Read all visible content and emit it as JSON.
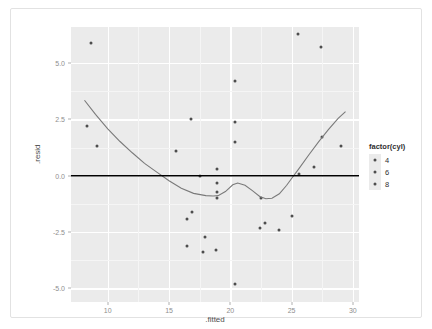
{
  "chart_data": {
    "type": "scatter",
    "title": "",
    "xlabel": ".fitted",
    "ylabel": ".resid",
    "xlim": [
      7.0,
      30.5
    ],
    "ylim": [
      -5.6,
      6.6
    ],
    "xticks": [
      10,
      15,
      20,
      25,
      30
    ],
    "xtick_labels": [
      "10",
      "15",
      "20",
      "25",
      "30"
    ],
    "yticks": [
      5.0,
      2.5,
      0.0,
      -2.5,
      -5.0
    ],
    "ytick_labels": [
      "5.0",
      "2.5",
      "0.0",
      "-2.5",
      "-5.0"
    ],
    "grid": true,
    "grid_major_color": "#ffffff",
    "grid_minor_color": "#f5f5f5",
    "panel_background": "#ebebeb",
    "point_color": "#4d4d4d",
    "smooth_color": "#7a7a7a",
    "hline_color": "#000000",
    "hline_y": 0,
    "legend": {
      "title": "factor(cyl)",
      "position": "right",
      "entries": [
        {
          "label": "4",
          "color": "#4d4d4d"
        },
        {
          "label": "6",
          "color": "#4d4d4d"
        },
        {
          "label": "8",
          "color": "#4d4d4d"
        }
      ]
    },
    "series": [
      {
        "name": "residuals",
        "points": [
          {
            "x": 8.6,
            "y": 5.9,
            "cyl": 8
          },
          {
            "x": 8.3,
            "y": 2.2,
            "cyl": 8
          },
          {
            "x": 9.1,
            "y": 1.3,
            "cyl": 8
          },
          {
            "x": 15.6,
            "y": 1.1,
            "cyl": 6
          },
          {
            "x": 16.8,
            "y": 2.5,
            "cyl": 6
          },
          {
            "x": 17.5,
            "y": 0.0,
            "cyl": 6
          },
          {
            "x": 18.9,
            "y": 0.3,
            "cyl": 6
          },
          {
            "x": 18.9,
            "y": -0.3,
            "cyl": 6
          },
          {
            "x": 18.9,
            "y": -0.7,
            "cyl": 6
          },
          {
            "x": 18.9,
            "y": -1.0,
            "cyl": 6
          },
          {
            "x": 20.4,
            "y": 4.2,
            "cyl": 4
          },
          {
            "x": 20.4,
            "y": 2.4,
            "cyl": 4
          },
          {
            "x": 20.4,
            "y": 1.5,
            "cyl": 4
          },
          {
            "x": 20.4,
            "y": -4.8,
            "cyl": 4
          },
          {
            "x": 22.5,
            "y": -1.0,
            "cyl": 4
          },
          {
            "x": 22.4,
            "y": -2.3,
            "cyl": 4
          },
          {
            "x": 22.8,
            "y": -2.1,
            "cyl": 4
          },
          {
            "x": 24.0,
            "y": -2.4,
            "cyl": 4
          },
          {
            "x": 25.0,
            "y": -1.8,
            "cyl": 4
          },
          {
            "x": 25.6,
            "y": 0.1,
            "cyl": 4
          },
          {
            "x": 26.8,
            "y": 0.4,
            "cyl": 4
          },
          {
            "x": 27.5,
            "y": 1.7,
            "cyl": 4
          },
          {
            "x": 29.0,
            "y": 1.3,
            "cyl": 4
          },
          {
            "x": 25.5,
            "y": 6.3,
            "cyl": 4
          },
          {
            "x": 27.4,
            "y": 5.7,
            "cyl": 4
          },
          {
            "x": 16.9,
            "y": -1.6,
            "cyl": 6
          },
          {
            "x": 17.9,
            "y": -2.7,
            "cyl": 6
          },
          {
            "x": 16.5,
            "y": -3.1,
            "cyl": 6
          },
          {
            "x": 17.8,
            "y": -3.4,
            "cyl": 6
          },
          {
            "x": 18.8,
            "y": -3.3,
            "cyl": 6
          },
          {
            "x": 16.5,
            "y": -1.9,
            "cyl": 6
          }
        ]
      }
    ],
    "smooth_curve": {
      "name": "loess",
      "x": [
        8.1,
        9.0,
        10.0,
        11.0,
        12.0,
        13.0,
        14.0,
        15.0,
        16.0,
        17.0,
        18.0,
        18.6,
        19.0,
        19.6,
        20.2,
        20.6,
        21.2,
        21.8,
        22.4,
        22.9,
        23.4,
        24.0,
        24.6,
        25.0,
        25.6,
        26.4,
        27.2,
        28.0,
        28.8,
        29.4
      ],
      "y": [
        3.35,
        2.72,
        2.08,
        1.52,
        1.02,
        0.55,
        0.16,
        -0.22,
        -0.55,
        -0.78,
        -0.88,
        -0.9,
        -0.88,
        -0.7,
        -0.4,
        -0.32,
        -0.42,
        -0.66,
        -0.92,
        -1.02,
        -1.0,
        -0.8,
        -0.42,
        -0.12,
        0.32,
        0.92,
        1.5,
        2.05,
        2.55,
        2.85
      ]
    }
  },
  "axis": {
    "x_title": ".fitted",
    "y_title": ".resid"
  }
}
